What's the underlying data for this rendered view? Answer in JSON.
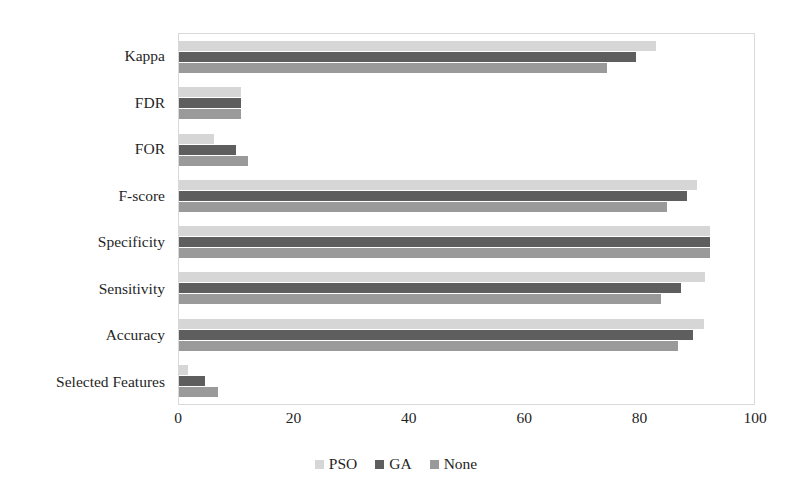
{
  "chart_data": {
    "type": "bar",
    "orientation": "horizontal",
    "title": "",
    "xlabel": "",
    "ylabel": "",
    "xlim": [
      0,
      100
    ],
    "xticks": [
      0,
      20,
      40,
      60,
      80,
      100
    ],
    "grid": false,
    "legend_position": "bottom",
    "categories": [
      "Kappa",
      "FDR",
      "FOR",
      "F-score",
      "Specificity",
      "Sensitivity",
      "Accuracy",
      "Selected Features"
    ],
    "series": [
      {
        "name": "PSO",
        "color": "#d6d6d6",
        "values": [
          83.0,
          10.7,
          6.1,
          90.1,
          92.4,
          91.5,
          91.3,
          1.6
        ]
      },
      {
        "name": "GA",
        "color": "#5e5e5e",
        "values": [
          79.4,
          10.7,
          9.9,
          88.4,
          92.4,
          87.3,
          89.4,
          4.5
        ]
      },
      {
        "name": "None",
        "color": "#9a9a9a",
        "values": [
          74.5,
          10.7,
          12.0,
          84.9,
          92.4,
          83.9,
          86.7,
          6.8
        ]
      }
    ]
  },
  "legend": {
    "items": [
      {
        "label": "PSO",
        "color": "#d6d6d6"
      },
      {
        "label": "GA",
        "color": "#5e5e5e"
      },
      {
        "label": "None",
        "color": "#9a9a9a"
      }
    ]
  },
  "axis": {
    "x_tick_labels": [
      "0",
      "20",
      "40",
      "60",
      "80",
      "100"
    ]
  }
}
